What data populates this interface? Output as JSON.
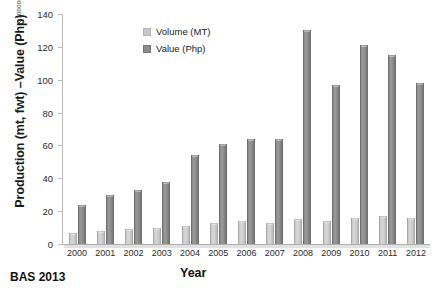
{
  "chart_data": {
    "type": "bar",
    "title": "",
    "xlabel": "Year",
    "ylabel": "Production (mt, fwt) –Value (Php)",
    "multiplier_note": "x 100000",
    "categories": [
      "2000",
      "2001",
      "2002",
      "2003",
      "2004",
      "2005",
      "2006",
      "2007",
      "2008",
      "2009",
      "2010",
      "2011",
      "2012"
    ],
    "series": [
      {
        "name": "Volume (MT)",
        "color": "#c9c9c9",
        "values": [
          7,
          8,
          9,
          10,
          11,
          13,
          14,
          13,
          15,
          14,
          16,
          17,
          16
        ]
      },
      {
        "name": "Value (Php)",
        "color": "#8c8c8c",
        "values": [
          24,
          30,
          33,
          38,
          54,
          61,
          64,
          64,
          130,
          97,
          121,
          115,
          98
        ]
      }
    ],
    "ylim": [
      0,
      140
    ],
    "yticks": [
      0,
      20,
      40,
      60,
      80,
      100,
      120,
      140
    ],
    "grid": false,
    "legend_position": "top-center"
  },
  "legend": {
    "items": [
      {
        "label": "Volume (MT)",
        "swatch": "legend-swatch-volume"
      },
      {
        "label": "Value (Php)",
        "swatch": "legend-swatch-value"
      }
    ]
  },
  "source": {
    "caption": "BAS 2013"
  }
}
